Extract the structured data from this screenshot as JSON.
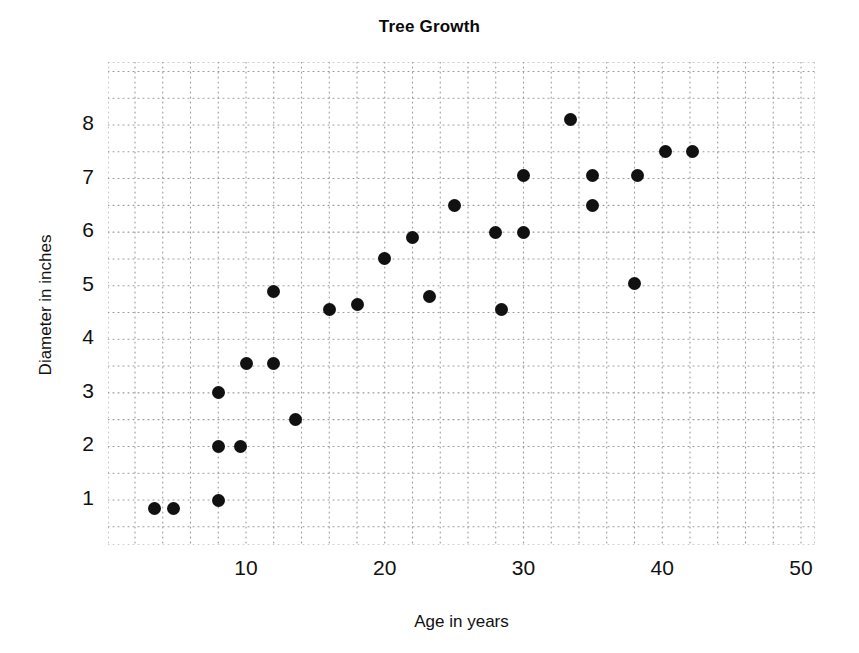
{
  "chart_data": {
    "type": "scatter",
    "title": "Tree Growth",
    "xlabel": "Age in years",
    "ylabel": "Diameter in inches",
    "xlim": [
      0,
      51
    ],
    "ylim": [
      0,
      9
    ],
    "xticks": [
      10,
      20,
      30,
      40,
      50
    ],
    "yticks": [
      1,
      2,
      3,
      4,
      5,
      6,
      7,
      8
    ],
    "xtick_labels": [
      "10",
      "20",
      "30",
      "40",
      "50"
    ],
    "ytick_labels": [
      "1",
      "2",
      "3",
      "4",
      "5",
      "6",
      "7",
      "8"
    ],
    "grid": true,
    "grid_style": "dotted",
    "grid_minor_x_step": 2,
    "grid_minor_y_step": 0.5,
    "legend": null,
    "marker": "filled-circle",
    "marker_color": "#111111",
    "points": [
      {
        "x": 3.4,
        "y": 0.85
      },
      {
        "x": 4.8,
        "y": 0.85
      },
      {
        "x": 8.0,
        "y": 1.0
      },
      {
        "x": 8.0,
        "y": 2.0
      },
      {
        "x": 9.6,
        "y": 2.0
      },
      {
        "x": 8.0,
        "y": 3.0
      },
      {
        "x": 10.0,
        "y": 3.55
      },
      {
        "x": 12.0,
        "y": 3.55
      },
      {
        "x": 12.0,
        "y": 4.9
      },
      {
        "x": 13.6,
        "y": 2.5
      },
      {
        "x": 16.0,
        "y": 4.55
      },
      {
        "x": 18.0,
        "y": 4.65
      },
      {
        "x": 20.0,
        "y": 5.5
      },
      {
        "x": 22.0,
        "y": 5.9
      },
      {
        "x": 23.2,
        "y": 4.8
      },
      {
        "x": 25.0,
        "y": 6.5
      },
      {
        "x": 28.0,
        "y": 6.0
      },
      {
        "x": 28.4,
        "y": 4.55
      },
      {
        "x": 30.0,
        "y": 6.0
      },
      {
        "x": 30.0,
        "y": 7.05
      },
      {
        "x": 33.4,
        "y": 8.1
      },
      {
        "x": 35.0,
        "y": 6.5
      },
      {
        "x": 35.0,
        "y": 7.05
      },
      {
        "x": 38.0,
        "y": 5.05
      },
      {
        "x": 38.2,
        "y": 7.05
      },
      {
        "x": 40.2,
        "y": 7.5
      },
      {
        "x": 42.2,
        "y": 7.5
      }
    ]
  }
}
